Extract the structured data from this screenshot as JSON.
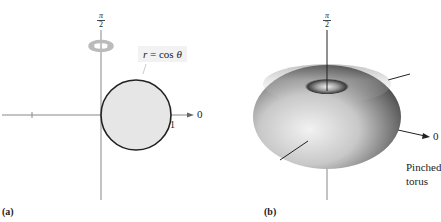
{
  "panel_a": {
    "sub_label": "(a)",
    "equation": {
      "var": "r",
      "eq": " = cos ",
      "theta": "θ"
    },
    "axis_top_label": {
      "num": "π",
      "den": "2"
    },
    "axis_right_label": "0",
    "tick_label_right": "1",
    "curve": {
      "type": "circle",
      "center": [
        0.5,
        0
      ],
      "radius": 0.5,
      "fill": "#e6e6e6",
      "stroke": "#222222"
    },
    "rotation_icon": "rotation-arrow-icon"
  },
  "panel_b": {
    "sub_label": "(b)",
    "axis_top_label": {
      "num": "π",
      "den": "2"
    },
    "axis_right_label": "0",
    "caption_line1": "Pinched",
    "caption_line2": "torus",
    "surface": {
      "type": "pinched-torus",
      "shade_light": "#e8e8e8",
      "shade_dark": "#3a3a3a"
    }
  }
}
